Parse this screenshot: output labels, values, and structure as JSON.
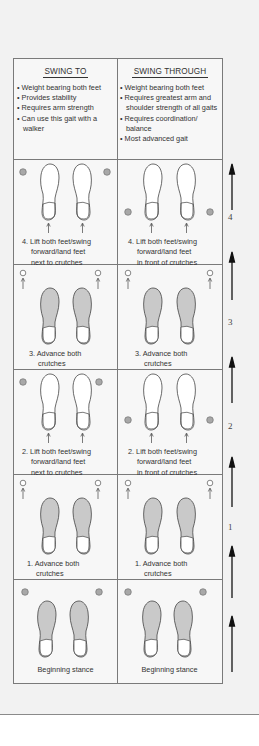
{
  "columns": [
    {
      "title": "SWING TO",
      "bullets": [
        "Weight bearing both feet",
        "Provides stability",
        "Requires arm strength",
        "Can use this gait with a walker"
      ]
    },
    {
      "title": "SWING THROUGH",
      "bullets": [
        "Weight bearing both feet",
        "Requires greatest arm and shoulder strength of all gaits",
        "Requires coordination/ balance",
        "Most advanced gait"
      ]
    }
  ],
  "rows": [
    {
      "step": "4",
      "swing_to": [
        "4. Lift both feet/swing",
        "forward/land feet",
        "next to crutches"
      ],
      "swing_through": [
        "4. Lift both feet/swing",
        "forward/land feet",
        "in front of crutches"
      ]
    },
    {
      "step": "3",
      "swing_to": [
        "3. Advance both",
        "crutches"
      ],
      "swing_through": [
        "3. Advance both",
        "crutches"
      ]
    },
    {
      "step": "2",
      "swing_to": [
        "2. Lift both feet/swing",
        "forward/land feet",
        "next to crutches"
      ],
      "swing_through": [
        "2. Lift both feet/swing",
        "forward/land feet",
        "in front of crutches"
      ]
    },
    {
      "step": "1",
      "swing_to": [
        "1. Advance both",
        "crutches"
      ],
      "swing_through": [
        "1. Advance both",
        "crutches"
      ]
    },
    {
      "step": "",
      "swing_to": [
        "Beginning stance"
      ],
      "swing_through": [
        "Beginning stance"
      ]
    }
  ],
  "colors": {
    "panel_bg": "#f2f2f2",
    "line": "#7a7a7a",
    "foot_fill_shaded": "#c9c9c9",
    "crutch_dot": "#a8a8a8"
  }
}
